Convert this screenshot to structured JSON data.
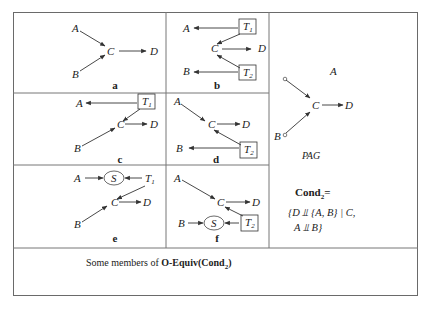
{
  "figure": {
    "header_partial": "Chapter (cut off)",
    "panels": [
      {
        "id": "a",
        "label": "a",
        "nodes": [
          "A",
          "B",
          "C",
          "D"
        ],
        "edges": [
          "A->C",
          "B->C",
          "C->D"
        ]
      },
      {
        "id": "b",
        "label": "b",
        "nodes": [
          "A",
          "B",
          "C",
          "D",
          "T1",
          "T2"
        ],
        "edges": [
          "T1->A",
          "T1->C",
          "C->D",
          "T2->C",
          "T2->B"
        ]
      },
      {
        "id": "c",
        "label": "c",
        "nodes": [
          "A",
          "B",
          "C",
          "D",
          "T1"
        ],
        "edges": [
          "T1->A",
          "T1->C",
          "B->C",
          "C->D"
        ]
      },
      {
        "id": "d",
        "label": "d",
        "nodes": [
          "A",
          "B",
          "C",
          "D",
          "T2"
        ],
        "edges": [
          "A->C",
          "C->D",
          "T2->C",
          "T2->B"
        ]
      },
      {
        "id": "e",
        "label": "e",
        "nodes": [
          "A",
          "S",
          "T1",
          "B",
          "C",
          "D"
        ],
        "edges": [
          "A->S",
          "T1->S",
          "T1->C",
          "B->C",
          "C->D"
        ]
      },
      {
        "id": "f",
        "label": "f",
        "nodes": [
          "A",
          "B",
          "S",
          "T2",
          "C",
          "D"
        ],
        "edges": [
          "A->C",
          "C->D",
          "B->S",
          "T2->S",
          "T2->C"
        ]
      }
    ],
    "pag": {
      "label": "PAG",
      "nodes": [
        "A",
        "B",
        "C",
        "D"
      ],
      "edges": [
        "A o-> C",
        "B o-> C",
        "C -> D"
      ]
    },
    "condition": {
      "title": "Cond",
      "title_sub": "2",
      "title_suffix": "=",
      "line1": "{D ⫫ {A, B} | C,",
      "line2": "A ⫫ B}"
    },
    "caption": {
      "prefix": "Some members of ",
      "bold": "O-Equiv(Cond",
      "sub": "2",
      "suffix": ")"
    }
  }
}
